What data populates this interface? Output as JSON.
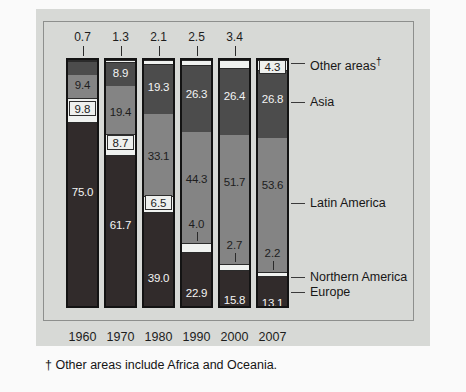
{
  "figure": {
    "footnote": "† Other areas include Africa and Oceania."
  },
  "legend": [
    {
      "key": "other",
      "label": "Other areas†"
    },
    {
      "key": "asia",
      "label": "Asia"
    },
    {
      "key": "latin",
      "label": "Latin America"
    },
    {
      "key": "northern",
      "label": "Northern America"
    },
    {
      "key": "europe",
      "label": "Europe"
    }
  ],
  "colors": {
    "other": "#f0f2f0",
    "asia": "#4c4c4c",
    "latin": "#848484",
    "northern": "#f0f2f0",
    "europe": "#312b2b",
    "frame": "#8d8f8d",
    "plate": "#d7d9d6",
    "outline": "#131313"
  },
  "axis": {
    "categories": [
      "1960",
      "1970",
      "1980",
      "1990",
      "2000",
      "2007"
    ]
  },
  "values": {
    "other": [
      "0.7",
      "1.3",
      "2.1",
      "2.5",
      "3.4",
      "4.3"
    ],
    "asia": [
      "5.1",
      "8.9",
      "19.3",
      "26.3",
      "26.4",
      "26.8"
    ],
    "latin": [
      "9.4",
      "19.4",
      "33.1",
      "44.3",
      "51.7",
      "53.6"
    ],
    "northern": [
      "9.8",
      "8.7",
      "6.5",
      "4.0",
      "2.7",
      "2.2"
    ],
    "europe": [
      "75.0",
      "61.7",
      "39.0",
      "22.9",
      "15.8",
      "13.1"
    ]
  },
  "chart_data": {
    "type": "bar",
    "title": "",
    "subtitle": "",
    "xlabel": "",
    "ylabel": "",
    "ylim": [
      0,
      100
    ],
    "grid": false,
    "stacked": true,
    "percent": true,
    "legend_position": "right-callouts",
    "categories": [
      "1960",
      "1970",
      "1980",
      "1990",
      "2000",
      "2007"
    ],
    "series": [
      {
        "name": "Other areas†",
        "values": [
          0.7,
          1.3,
          2.1,
          2.5,
          3.4,
          4.3
        ]
      },
      {
        "name": "Asia",
        "values": [
          5.1,
          8.9,
          19.3,
          26.3,
          26.4,
          26.8
        ]
      },
      {
        "name": "Latin America",
        "values": [
          9.4,
          19.4,
          33.1,
          44.3,
          51.7,
          53.6
        ]
      },
      {
        "name": "Northern America",
        "values": [
          9.8,
          8.7,
          6.5,
          4.0,
          2.7,
          2.2
        ]
      },
      {
        "name": "Europe",
        "values": [
          75.0,
          61.7,
          39.0,
          22.9,
          15.8,
          13.1
        ]
      }
    ],
    "stack_order_top_to_bottom": [
      "Other areas†",
      "Asia",
      "Latin America",
      "Northern America",
      "Europe"
    ],
    "annotations": [
      "† Other areas include Africa and Oceania."
    ]
  }
}
